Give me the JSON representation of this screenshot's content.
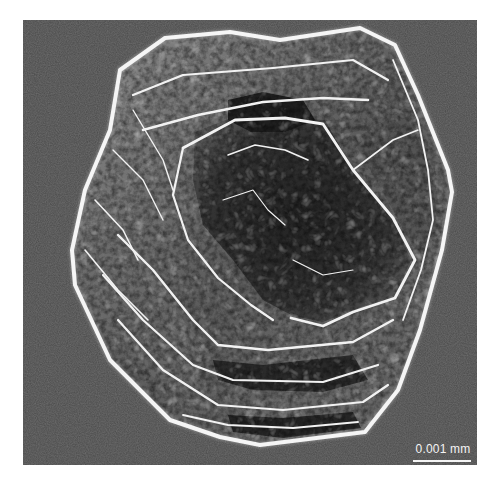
{
  "image": {
    "subject": "Scanning electron micrograph of a crystal grain",
    "background_color": "#4a4a4a",
    "highlight_color": "#f2f2f2",
    "shadow_color": "#1e1e1e"
  },
  "scale_bar": {
    "label": "0.001 mm",
    "color": "#f4f4f4"
  }
}
